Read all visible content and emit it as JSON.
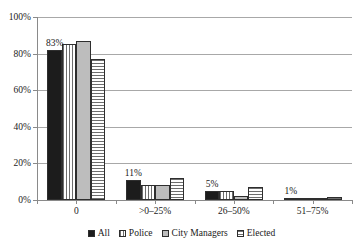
{
  "chart_data": {
    "type": "bar",
    "title": "",
    "xlabel": "",
    "ylabel": "",
    "ylim": [
      0,
      100
    ],
    "yticks": [
      "0%",
      "20%",
      "40%",
      "60%",
      "80%",
      "100%"
    ],
    "ytick_values": [
      0,
      20,
      40,
      60,
      80,
      100
    ],
    "grid": true,
    "legend_position": "bottom",
    "categories": [
      "0",
      ">0–25%",
      "26–50%",
      "51–75%"
    ],
    "series": [
      {
        "name": "All",
        "pattern": "solid-dark",
        "values": [
          82,
          11,
          5,
          1
        ]
      },
      {
        "name": "Police",
        "pattern": "vstripe",
        "values": [
          85,
          8,
          5,
          0.6
        ]
      },
      {
        "name": "City Managers",
        "pattern": "solid-gray",
        "values": [
          87,
          8,
          2,
          0.4
        ]
      },
      {
        "name": "Elected",
        "pattern": "hstripe",
        "values": [
          77,
          12,
          7,
          1.5
        ]
      }
    ],
    "data_labels": [
      {
        "category": "0",
        "series": "All",
        "text": "83%"
      },
      {
        "category": ">0–25%",
        "series": "All",
        "text": "11%"
      },
      {
        "category": "26–50%",
        "series": "All",
        "text": "5%"
      },
      {
        "category": "51–75%",
        "series": "All",
        "text": "1%"
      }
    ]
  },
  "legend": {
    "items": [
      {
        "label": "All"
      },
      {
        "label": "Police"
      },
      {
        "label": "City Managers"
      },
      {
        "label": "Elected"
      }
    ]
  }
}
